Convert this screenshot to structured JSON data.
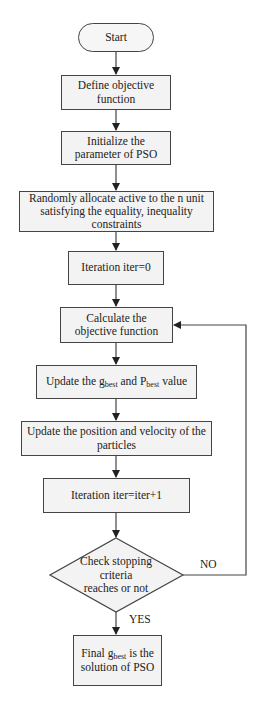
{
  "flowchart": {
    "start": "Start",
    "steps": [
      {
        "id": "define",
        "text": "Define objective function"
      },
      {
        "id": "init",
        "text": "Initialize the parameter of PSO"
      },
      {
        "id": "allocate",
        "text": "Randomly allocate active to the n unit satisfying the equality, inequality constraints"
      },
      {
        "id": "iter0",
        "text": "Iteration iter=0"
      },
      {
        "id": "calc",
        "text": "Calculate the objective function"
      },
      {
        "id": "update_best",
        "text_pre": "Update the g",
        "sub1": "best",
        "text_mid": " and P",
        "sub2": "best",
        "text_post": " value"
      },
      {
        "id": "update_pos",
        "text": "Update the position and velocity of the particles"
      },
      {
        "id": "iter_inc",
        "text": "Iteration iter=iter+1"
      }
    ],
    "decision": "Check stopping criteria reaches or not",
    "decision_lines": [
      "Check stopping",
      "criteria",
      "reaches or not"
    ],
    "no_label": "NO",
    "yes_label": "YES",
    "final": {
      "text_pre": "Final g",
      "sub": "best",
      "text_post": " is the solution of PSO"
    }
  },
  "colors": {
    "line": "#444444",
    "fill": "#f3f3f3"
  }
}
